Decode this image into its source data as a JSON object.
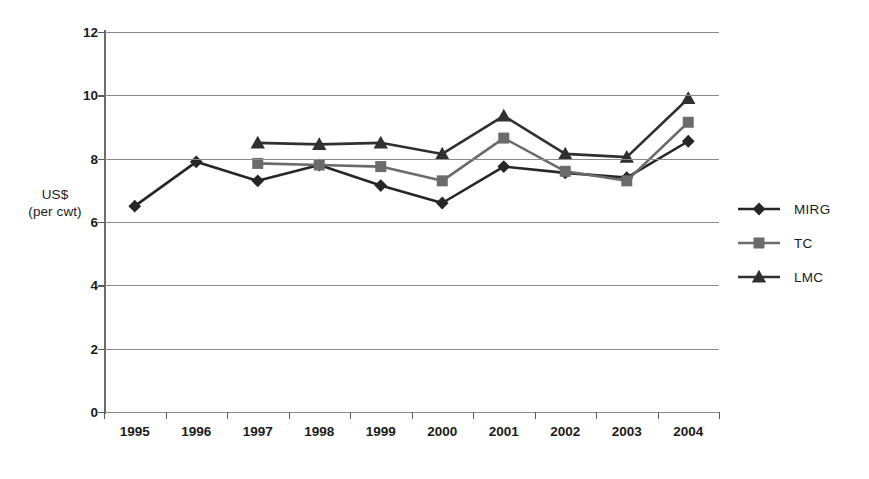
{
  "chart_data": {
    "type": "line",
    "title": "",
    "xlabel": "",
    "ylabel": "US$ (per cwt)",
    "ylabel_line1": "US$",
    "ylabel_line2": "(per cwt)",
    "categories": [
      "1995",
      "1996",
      "1997",
      "1998",
      "1999",
      "2000",
      "2001",
      "2002",
      "2003",
      "2004"
    ],
    "ylim": [
      0,
      12
    ],
    "yticks": [
      0,
      2,
      4,
      6,
      8,
      10,
      12
    ],
    "ytick_labels": [
      "0",
      "2",
      "4",
      "6",
      "8",
      "10",
      "12"
    ],
    "grid": true,
    "legend_position": "right",
    "series": [
      {
        "name": "MIRG",
        "marker": "diamond",
        "color": "#262626",
        "x": [
          "1995",
          "1996",
          "1997",
          "1998",
          "1999",
          "2000",
          "2001",
          "2002",
          "2003",
          "2004"
        ],
        "values": [
          6.5,
          7.9,
          7.3,
          7.8,
          7.15,
          6.6,
          7.75,
          7.55,
          7.4,
          8.55
        ]
      },
      {
        "name": "TC",
        "marker": "square",
        "color": "#6b6b6b",
        "x": [
          "1997",
          "1998",
          "1999",
          "2000",
          "2001",
          "2002",
          "2003",
          "2004"
        ],
        "values": [
          7.85,
          7.8,
          7.75,
          7.3,
          8.65,
          7.6,
          7.3,
          9.15
        ]
      },
      {
        "name": "LMC",
        "marker": "triangle",
        "color": "#303030",
        "x": [
          "1997",
          "1998",
          "1999",
          "2000",
          "2001",
          "2002",
          "2003",
          "2004"
        ],
        "values": [
          8.5,
          8.45,
          8.5,
          8.15,
          9.35,
          8.15,
          8.05,
          9.9
        ]
      }
    ]
  },
  "legend": {
    "items": [
      {
        "label": "MIRG",
        "marker": "diamond",
        "color": "#262626"
      },
      {
        "label": "TC",
        "marker": "square",
        "color": "#6b6b6b"
      },
      {
        "label": "LMC",
        "marker": "triangle",
        "color": "#303030"
      }
    ]
  },
  "colors": {
    "background": "#ffffff",
    "axis": "#6d6d6d",
    "grid": "#8a8a8a",
    "text": "#1b1b1b",
    "mirg": "#262626",
    "tc": "#6b6b6b",
    "lmc": "#303030"
  }
}
